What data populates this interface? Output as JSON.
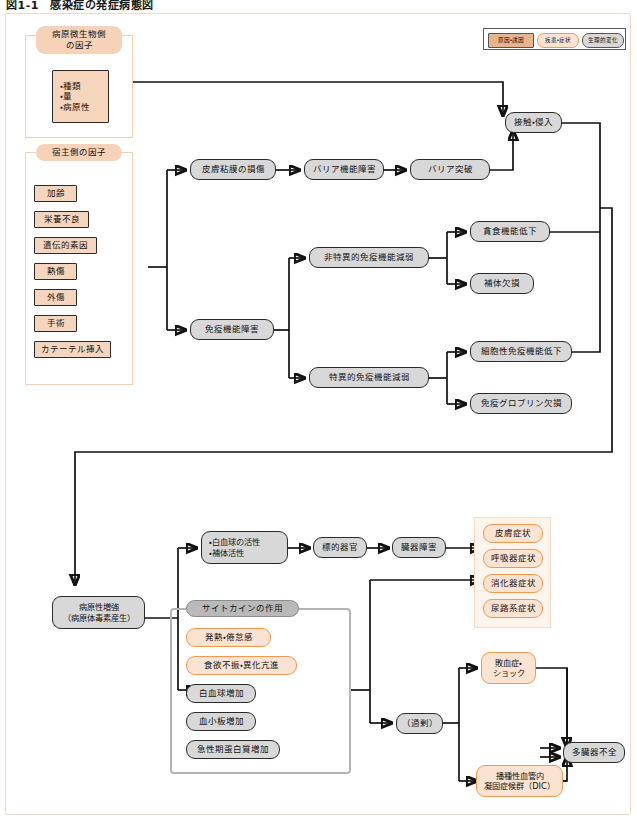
{
  "figure": {
    "title": "図1-1　感染症の発症病態図"
  },
  "legend": {
    "items": [
      {
        "label": "原因・誘因",
        "style": "cause",
        "color": "#e8b48d"
      },
      {
        "label": "疾患・症状",
        "style": "disease",
        "color": "#ef9a50"
      },
      {
        "label": "生理的変化",
        "style": "physiological",
        "color": "#d8d8d8"
      }
    ]
  },
  "groups": {
    "pathogen_factors": {
      "title": "病原微生物側\nの因子",
      "items": [
        "・種類\n・量\n・病原性"
      ]
    },
    "host_factors": {
      "title": "宿主側の因子",
      "items": [
        "加齢",
        "栄養不良",
        "遺伝的素因",
        "熱傷",
        "外傷",
        "手術",
        "カテーテル挿入"
      ]
    },
    "cytokine": {
      "title": "サイトカインの作用",
      "items": [
        {
          "label": "発熱・倦怠感",
          "style": "orange"
        },
        {
          "label": "食欲不振・異化亢進",
          "style": "orange"
        },
        {
          "label": "白血球増加",
          "style": "gray"
        },
        {
          "label": "血小板増加",
          "style": "gray"
        },
        {
          "label": "急性期蛋白質増加",
          "style": "gray"
        }
      ]
    },
    "organ_symptoms": {
      "items": [
        "皮膚症状",
        "呼吸器症状",
        "消化器症状",
        "尿路系症状"
      ]
    }
  },
  "nodes": {
    "skin_mucosa_damage": "皮膚粘膜の損傷",
    "barrier_dysfunction": "バリア機能障害",
    "barrier_breach": "バリア突破",
    "contact_invasion": "接触・侵入",
    "immune_dysfunction": "免疫機能障害",
    "nonspecific_immunity": "非特異的免疫機能減弱",
    "specific_immunity": "特異的免疫機能減弱",
    "phagocytosis_decline": "貪食機能低下",
    "complement_deficiency": "補体欠損",
    "cellular_immunity_decline": "細胞性免疫機能低下",
    "immunoglobulin_deficiency": "免疫グロブリン欠損",
    "pathogenicity_enhancement": "病原性増強\n（病原体毒素産生）",
    "leukocyte_complement_activation": "・白血球の活性\n・補体活性",
    "target_organ": "標的器官",
    "organ_damage": "臓器障害",
    "excess": "（過剰）",
    "sepsis_shock": "敗血症・\nショック",
    "dic": "播種性血管内\n凝固症候群（DIC）",
    "multiple_organ_failure": "多臓器不全"
  }
}
